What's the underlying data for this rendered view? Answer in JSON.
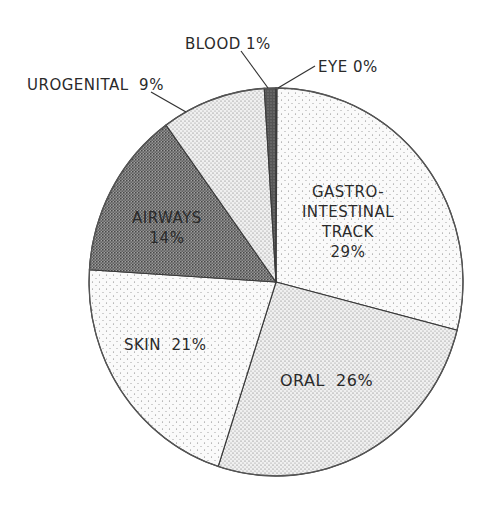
{
  "chart_data": {
    "type": "pie",
    "title": "",
    "start_angle_deg": 0,
    "direction": "clockwise",
    "slices": [
      {
        "label": "GASTRO-INTESTINAL TRACK",
        "value": 29,
        "pattern": "light-dots",
        "fill": "#f1f1f1"
      },
      {
        "label": "ORAL",
        "value": 26,
        "pattern": "medium-dots",
        "fill": "#d9d9d9"
      },
      {
        "label": "SKIN",
        "value": 21,
        "pattern": "light-dots",
        "fill": "#f3f3f3"
      },
      {
        "label": "AIRWAYS",
        "value": 14,
        "pattern": "dense-stipple",
        "fill": "#7a7a7a"
      },
      {
        "label": "UROGENITAL",
        "value": 9,
        "pattern": "medium-dots",
        "fill": "#e6e6e6"
      },
      {
        "label": "BLOOD",
        "value": 1,
        "pattern": "dark",
        "fill": "#555555"
      },
      {
        "label": "EYE",
        "value": 0,
        "pattern": "light-dots",
        "fill": "#f1f1f1"
      }
    ],
    "units": "%"
  },
  "labels": {
    "gi_line1": "GASTRO-",
    "gi_line2": "INTESTINAL",
    "gi_line3": "TRACK",
    "gi_pct": "29%",
    "oral": "ORAL  26%",
    "skin": "SKIN  21%",
    "airways_line1": "AIRWAYS",
    "airways_pct": "14%",
    "urogenital": "UROGENITAL  9%",
    "blood": "BLOOD 1%",
    "eye": "EYE 0%"
  }
}
